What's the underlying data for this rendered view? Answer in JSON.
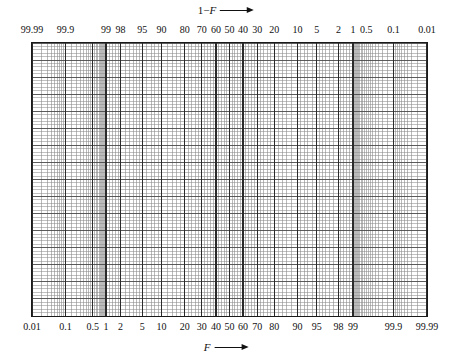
{
  "figure": {
    "type": "normal-probability-paper"
  },
  "top_axis": {
    "title_prefix": "1−",
    "title_symbol": "F",
    "arrow": "right-arrow",
    "direction": "increasing to the right",
    "tick_labels": [
      "99.99",
      "99.9",
      "99",
      "98",
      "95",
      "90",
      "80",
      "70",
      "60",
      "50",
      "40",
      "30",
      "20",
      "10",
      "5",
      "2",
      "1",
      "0.5",
      "0.1",
      "0.01"
    ]
  },
  "bottom_axis": {
    "title_symbol": "F",
    "arrow": "right-arrow",
    "direction": "increasing to the right",
    "tick_labels": [
      "0.01",
      "0.1",
      "0.5",
      "1",
      "2",
      "5",
      "10",
      "20",
      "30",
      "40",
      "50",
      "60",
      "70",
      "80",
      "90",
      "95",
      "98",
      "99",
      "99.9",
      "99.99"
    ]
  },
  "chart_data": {
    "type": "line",
    "title": "",
    "subtitle": "",
    "xlabel": "F",
    "ylabel": "",
    "grid": true,
    "legend": "none",
    "x_scale": "probit (normal probability)",
    "y_scale": "linear",
    "xlim": [
      0.01,
      99.99
    ],
    "ylim": [
      0,
      1
    ],
    "x_tick_values": [
      0.01,
      0.1,
      0.5,
      1,
      2,
      5,
      10,
      20,
      30,
      40,
      50,
      60,
      70,
      80,
      90,
      95,
      98,
      99,
      99.9,
      99.99
    ],
    "x_tick_labels": [
      "0.01",
      "0.1",
      "0.5",
      "1",
      "2",
      "5",
      "10",
      "20",
      "30",
      "40",
      "50",
      "60",
      "70",
      "80",
      "90",
      "95",
      "98",
      "99",
      "99.9",
      "99.99"
    ],
    "secondary_x_tick_values": [
      99.99,
      99.9,
      99,
      98,
      95,
      90,
      80,
      70,
      60,
      50,
      40,
      30,
      20,
      10,
      5,
      2,
      1,
      0.5,
      0.1,
      0.01
    ],
    "secondary_x_tick_labels": [
      "99.99",
      "99.9",
      "99",
      "98",
      "95",
      "90",
      "80",
      "70",
      "60",
      "50",
      "40",
      "30",
      "20",
      "10",
      "5",
      "2",
      "1",
      "0.5",
      "0.1",
      "0.01"
    ],
    "y_tick_values": [],
    "y_tick_labels": [],
    "series": [],
    "values": [],
    "categories": [],
    "annotations": [
      {
        "text": "1−F →",
        "position": "top-center"
      },
      {
        "text": "F →",
        "position": "bottom-center"
      }
    ]
  },
  "grid_style": {
    "panel_border_color": "#1a1a1a",
    "minor_line_color": "#8c8c8c",
    "major_line_color": "#4a4a4a",
    "emphasis_line_color": "#2a2a2a",
    "background_color": "#ffffff"
  },
  "grid_spec": {
    "x_minor_probabilities": [
      0.01,
      0.02,
      0.03,
      0.04,
      0.05,
      0.06,
      0.07,
      0.08,
      0.09,
      0.1,
      0.15,
      0.2,
      0.25,
      0.3,
      0.35,
      0.4,
      0.45,
      0.5,
      0.55,
      0.6,
      0.65,
      0.7,
      0.75,
      0.8,
      0.85,
      0.9,
      0.95,
      1,
      1.2,
      1.4,
      1.6,
      1.8,
      2,
      2.5,
      3,
      3.5,
      4,
      4.5,
      5,
      6,
      7,
      8,
      9,
      10,
      12,
      14,
      16,
      18,
      20,
      22,
      24,
      26,
      28,
      30,
      32,
      34,
      36,
      38,
      40,
      42,
      44,
      46,
      48,
      50,
      52,
      54,
      56,
      58,
      60,
      62,
      64,
      66,
      68,
      70,
      72,
      74,
      76,
      78,
      80,
      82,
      84,
      86,
      88,
      90,
      91,
      92,
      93,
      94,
      95,
      95.5,
      96,
      96.5,
      97,
      97.5,
      98,
      98.2,
      98.4,
      98.6,
      98.8,
      99,
      99.05,
      99.1,
      99.15,
      99.2,
      99.25,
      99.3,
      99.35,
      99.4,
      99.45,
      99.5,
      99.55,
      99.6,
      99.65,
      99.7,
      99.75,
      99.8,
      99.85,
      99.9,
      99.91,
      99.92,
      99.93,
      99.94,
      99.95,
      99.96,
      99.97,
      99.98,
      99.99
    ],
    "x_major_probabilities": [
      0.01,
      0.1,
      0.5,
      1,
      2,
      5,
      10,
      20,
      30,
      40,
      50,
      60,
      70,
      80,
      90,
      95,
      98,
      99,
      99.9,
      99.99
    ],
    "y_minor_count": 80,
    "y_major_every": 5
  }
}
